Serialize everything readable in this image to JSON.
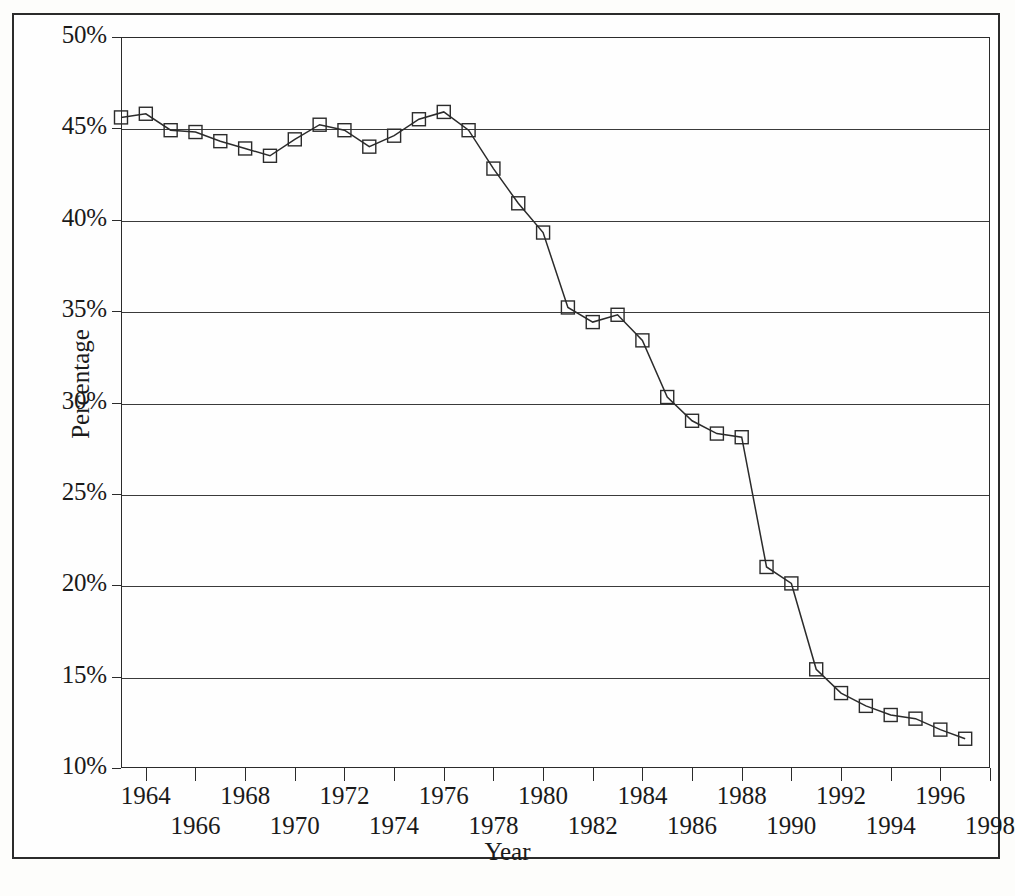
{
  "figure": {
    "y_axis_title": "Percentage",
    "x_axis_title": "Year"
  },
  "chart_data": {
    "type": "line",
    "title": "",
    "xlabel": "Year",
    "ylabel": "Percentage",
    "xlim": [
      1963,
      1998
    ],
    "ylim": [
      10,
      50
    ],
    "ytick_labels": [
      "50%",
      "45%",
      "40%",
      "35%",
      "30%",
      "25%",
      "20%",
      "15%",
      "10%"
    ],
    "ytick_values": [
      50,
      45,
      40,
      35,
      30,
      25,
      20,
      15,
      10
    ],
    "xtick_labels_upper": [
      "1964",
      "1968",
      "1972",
      "1976",
      "1980",
      "1984",
      "1988",
      "1992",
      "1996"
    ],
    "xtick_labels_lower": [
      "1966",
      "1970",
      "1974",
      "1978",
      "1982",
      "1986",
      "1990",
      "1994",
      "1998"
    ],
    "xtick_values_upper": [
      1964,
      1968,
      1972,
      1976,
      1980,
      1984,
      1988,
      1992,
      1996
    ],
    "xtick_values_lower": [
      1966,
      1970,
      1974,
      1978,
      1982,
      1986,
      1990,
      1994,
      1998
    ],
    "grid": "horizontal",
    "legend": "none",
    "marker": "open-square",
    "line_color": "#2b2b2b",
    "x": [
      1963,
      1964,
      1965,
      1966,
      1967,
      1968,
      1969,
      1970,
      1971,
      1972,
      1973,
      1974,
      1975,
      1976,
      1977,
      1978,
      1979,
      1980,
      1981,
      1982,
      1983,
      1984,
      1985,
      1986,
      1987,
      1988,
      1989,
      1990,
      1991,
      1992,
      1993,
      1994,
      1995,
      1996,
      1997
    ],
    "values": [
      45.6,
      45.8,
      44.9,
      44.8,
      44.3,
      43.9,
      43.5,
      44.4,
      45.2,
      44.9,
      44.0,
      44.6,
      45.5,
      45.9,
      44.9,
      42.8,
      40.9,
      39.3,
      35.2,
      34.4,
      34.8,
      33.4,
      30.3,
      29.0,
      28.3,
      28.1,
      21.0,
      20.1,
      15.4,
      14.1,
      13.4,
      12.9,
      12.7,
      12.1,
      11.6
    ],
    "series": [
      {
        "name": "Percentage",
        "values": [
          45.6,
          45.8,
          44.9,
          44.8,
          44.3,
          43.9,
          43.5,
          44.4,
          45.2,
          44.9,
          44.0,
          44.6,
          45.5,
          45.9,
          44.9,
          42.8,
          40.9,
          39.3,
          35.2,
          34.4,
          34.8,
          33.4,
          30.3,
          29.0,
          28.3,
          28.1,
          21.0,
          20.1,
          15.4,
          14.1,
          13.4,
          12.9,
          12.7,
          12.1,
          11.6
        ]
      }
    ]
  }
}
